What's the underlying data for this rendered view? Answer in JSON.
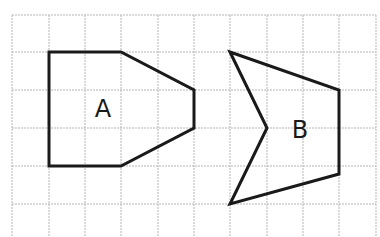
{
  "diagram": {
    "type": "grid-shapes",
    "grid": {
      "color": "#b5b5b5",
      "x_lines": [
        12,
        49,
        85,
        121,
        158,
        194,
        230,
        267,
        303,
        339,
        376
      ],
      "y_lines": [
        15,
        52,
        90,
        128,
        166,
        204
      ],
      "x_extent": [
        12,
        376
      ],
      "y_extent": [
        15,
        237
      ]
    },
    "shapes": [
      {
        "name": "A",
        "label": "A",
        "label_pos": [
          103,
          117
        ],
        "stroke": "#1a1a1a",
        "points": [
          [
            49,
            52
          ],
          [
            121,
            52
          ],
          [
            194,
            90
          ],
          [
            194,
            128
          ],
          [
            121,
            166
          ],
          [
            49,
            166
          ]
        ]
      },
      {
        "name": "B",
        "label": "B",
        "label_pos": [
          300,
          138
        ],
        "stroke": "#1a1a1a",
        "points": [
          [
            230,
            52
          ],
          [
            339,
            90
          ],
          [
            339,
            174
          ],
          [
            230,
            204
          ],
          [
            267,
            128
          ]
        ]
      }
    ]
  }
}
